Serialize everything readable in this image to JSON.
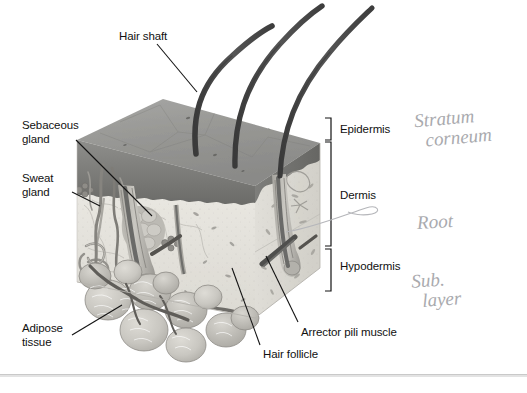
{
  "figure": {
    "background_color": "#ffffff",
    "width": 527,
    "height": 393
  },
  "printed_labels": [
    {
      "id": "hair-shaft",
      "text": "Hair shaft",
      "x": 119,
      "y": 30,
      "align": "left"
    },
    {
      "id": "sebaceous-gland",
      "text": "Sebaceous\ngland",
      "x": 22,
      "y": 119,
      "align": "left"
    },
    {
      "id": "sweat-gland",
      "text": "Sweat\ngland",
      "x": 22,
      "y": 172,
      "align": "left"
    },
    {
      "id": "adipose-tissue",
      "text": "Adipose\ntissue",
      "x": 22,
      "y": 322,
      "align": "left"
    },
    {
      "id": "hair-follicle",
      "text": "Hair follicle",
      "x": 263,
      "y": 348,
      "align": "left"
    },
    {
      "id": "arrector-pili-muscle",
      "text": "Arrector pili muscle",
      "x": 301,
      "y": 326,
      "align": "left"
    },
    {
      "id": "epidermis",
      "text": "Epidermis",
      "x": 340,
      "y": 123,
      "align": "left"
    },
    {
      "id": "dermis",
      "text": "Dermis",
      "x": 340,
      "y": 189,
      "align": "left"
    },
    {
      "id": "hypodermis",
      "text": "Hypodermis",
      "x": 340,
      "y": 260,
      "align": "left"
    }
  ],
  "handwritten_annotations": [
    {
      "id": "stratum-corneum",
      "text": "Stratum\n  corneum",
      "x": 415,
      "y": 108
    },
    {
      "id": "root",
      "text": "Root",
      "x": 417,
      "y": 212
    },
    {
      "id": "sub-layer",
      "text": "Sub.\n  layer",
      "x": 412,
      "y": 270
    }
  ],
  "brackets": [
    {
      "id": "epidermis-bracket",
      "label": "Epidermis",
      "top": 118,
      "bottom": 140
    },
    {
      "id": "dermis-bracket",
      "label": "Dermis",
      "top": 140,
      "bottom": 245
    },
    {
      "id": "hypodermis-bracket",
      "label": "Hypodermis",
      "top": 248,
      "bottom": 290
    }
  ],
  "colors": {
    "label_text": "#111111",
    "leader_line": "#1a1a1a",
    "handwriting": "#a9aaae",
    "epidermis_surface": "#9a9a9a",
    "epidermis_band": "#6f6f6f",
    "dermis_fill": "#e4e2dd",
    "dermis_side": "#d5d3cd",
    "hair": "#4a4a4a",
    "adipose": "#c6c5c0",
    "vessel": "#7d7c78",
    "rule": "#c9c9c9"
  },
  "structures": [
    "hair shafts (3)",
    "epidermis surface",
    "sebaceous gland",
    "sweat gland",
    "hair follicle",
    "arrector pili muscle",
    "adipose tissue lobules",
    "blood vessels"
  ]
}
